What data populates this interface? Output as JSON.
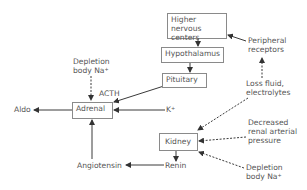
{
  "diagram": {
    "title": "",
    "nodes": {
      "higher_nervous": {
        "line1": "Higher nervous",
        "line2": "centers"
      },
      "hypothalamus": {
        "label": "Hypothalamus"
      },
      "pituitary": {
        "label": "Pituitary"
      },
      "adrenal": {
        "label": "Adrenal"
      },
      "kidney": {
        "label": "Kidney"
      }
    },
    "labels": {
      "peripheral": {
        "line1": "Peripheral",
        "line2": "receptors"
      },
      "loss_fluid": {
        "line1": "Loss fluid,",
        "line2": "electrolytes"
      },
      "depletion_top": {
        "line1": "Depletion",
        "line2": "body Na",
        "sup": "+"
      },
      "acth": "ACTH",
      "aldo": "Aldo",
      "k": "K",
      "k_sup": "+",
      "decreased": {
        "line1": "Decreased",
        "line2": "renal arterial",
        "line3": "pressure"
      },
      "depletion_bottom": {
        "line1": "Depletion",
        "line2": "body Na",
        "sup": "+"
      },
      "renin": "Renin",
      "angiotensin": "Angiotensin"
    },
    "edges": [
      {
        "from": "Higher nervous centers",
        "to": "Hypothalamus",
        "style": "solid"
      },
      {
        "from": "Hypothalamus",
        "to": "Pituitary",
        "style": "solid"
      },
      {
        "from": "Pituitary",
        "to": "Adrenal",
        "label": "ACTH",
        "style": "solid"
      },
      {
        "from": "Peripheral receptors",
        "to": "Higher nervous centers",
        "style": "solid"
      },
      {
        "from": "Loss fluid, electrolytes",
        "to": "Peripheral receptors",
        "style": "dashed"
      },
      {
        "from": "Loss fluid, electrolytes",
        "to": "Kidney",
        "style": "dashed"
      },
      {
        "from": "Decreased renal arterial pressure",
        "to": "Kidney",
        "style": "dashed"
      },
      {
        "from": "Depletion body Na+",
        "to": "Kidney",
        "style": "dashed"
      },
      {
        "from": "Depletion body Na+",
        "to": "Adrenal",
        "style": "dashed"
      },
      {
        "from": "K+",
        "to": "Adrenal",
        "style": "solid"
      },
      {
        "from": "Adrenal",
        "to": "Aldo",
        "style": "solid"
      },
      {
        "from": "Kidney",
        "to": "Renin",
        "style": "solid"
      },
      {
        "from": "Renin",
        "to": "Angiotensin",
        "style": "solid"
      },
      {
        "from": "Angiotensin",
        "to": "Adrenal",
        "style": "solid"
      }
    ],
    "colors": {
      "line": "#3a3a3a",
      "text": "#555555",
      "box_border": "#8a8a8a"
    }
  }
}
